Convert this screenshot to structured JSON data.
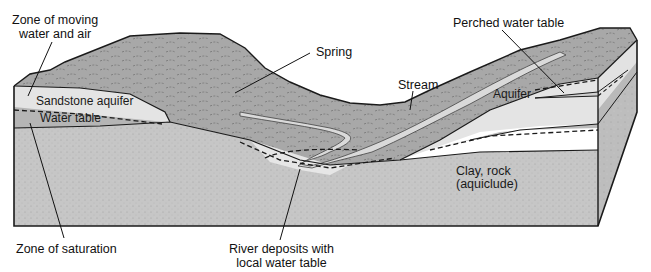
{
  "diagram": {
    "type": "groundwater-cross-section",
    "labels": {
      "zone_moving_water_air_line1": "Zone of moving",
      "zone_moving_water_air_line2": "water and air",
      "sandstone_aquifer": "Sandstone aquifer",
      "water_table": "Water table",
      "spring": "Spring",
      "stream": "Stream",
      "perched_water_table": "Perched water table",
      "aquifer": "Aquifer",
      "clay_rock_line1": "Clay, rock",
      "clay_rock_line2": "(aquiclude)",
      "zone_saturation": "Zone of saturation",
      "river_deposits_line1": "River deposits with",
      "river_deposits_line2": "local water table"
    },
    "colors": {
      "bedrock": "#c9c9c9",
      "aquifer_light": "#e6e6e6",
      "saturated_band": "#b8b8b8",
      "surface": "#a9a9a9",
      "stream": "#d8d8d8",
      "outline": "#1a1a1a"
    }
  }
}
